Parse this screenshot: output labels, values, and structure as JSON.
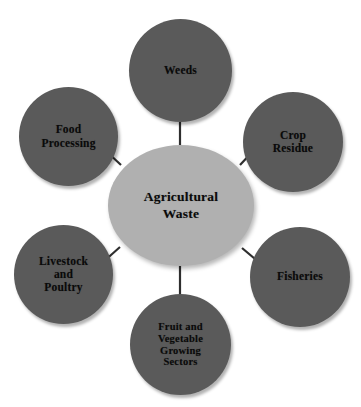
{
  "diagram": {
    "type": "hub-and-spoke",
    "background_color": "#ffffff",
    "hub_color": "#b0b0b0",
    "satellite_color": "#5a5a5a",
    "text_color": "#0a0a0a",
    "hub": {
      "label": "Agricultural\nWaste",
      "shape": "ellipse"
    },
    "satellites": [
      {
        "id": "weeds",
        "label": "Weeds",
        "position": "top",
        "shape": "circle"
      },
      {
        "id": "crop",
        "label": "Crop\nResidue",
        "position": "top-right",
        "shape": "circle"
      },
      {
        "id": "fisheries",
        "label": "Fisheries",
        "position": "bottom-right",
        "shape": "circle"
      },
      {
        "id": "fruit",
        "label": "Fruit and\nVegetable\nGrowing\nSectors",
        "position": "bottom",
        "shape": "circle"
      },
      {
        "id": "livestock",
        "label": "Livestock\nand\nPoultry",
        "position": "bottom-left",
        "shape": "circle"
      },
      {
        "id": "food",
        "label": "Food\nProcessing",
        "position": "top-left",
        "shape": "circle"
      }
    ],
    "connectors": [
      {
        "from": "hub",
        "to": "weeds"
      },
      {
        "from": "hub",
        "to": "crop"
      },
      {
        "from": "hub",
        "to": "fisheries"
      },
      {
        "from": "hub",
        "to": "fruit"
      },
      {
        "from": "hub",
        "to": "livestock"
      },
      {
        "from": "hub",
        "to": "food"
      }
    ]
  }
}
